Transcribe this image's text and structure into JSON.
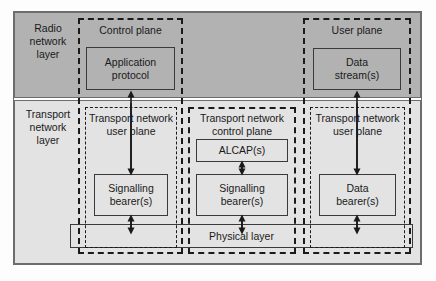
{
  "diagram": {
    "colors": {
      "radio_band_fill": "#b2b2b2",
      "transport_band_fill": "#e3e3e3",
      "line": "#1a1a1a",
      "frame": "#6d6d6d",
      "box_border": "#3a3a3a"
    },
    "layers": [
      {
        "id": "radio",
        "label": "Radio\nnetwork\nlayer"
      },
      {
        "id": "transport",
        "label": "Transport\nnetwork\nlayer"
      }
    ],
    "planes": [
      {
        "id": "control-plane",
        "label": "Control plane",
        "border": "thick-dashed"
      },
      {
        "id": "user-plane",
        "label": "User plane",
        "border": "thick-dashed"
      },
      {
        "id": "tn-user-plane-left",
        "label": "Transport network\nuser plane",
        "border": "thin-dashed"
      },
      {
        "id": "tn-control-plane",
        "label": "Transport network\ncontrol plane",
        "border": "thick-dashed"
      },
      {
        "id": "tn-user-plane-right",
        "label": "Transport network\nuser plane",
        "border": "thin-dashed"
      }
    ],
    "boxes": [
      {
        "id": "application-protocol",
        "label": "Application\nprotocol",
        "layer": "radio",
        "plane": "control-plane"
      },
      {
        "id": "data-stream",
        "label": "Data\nstream(s)",
        "layer": "radio",
        "plane": "user-plane"
      },
      {
        "id": "alcap",
        "label": "ALCAP(s)",
        "layer": "transport",
        "plane": "tn-control-plane"
      },
      {
        "id": "signalling-bearer-control",
        "label": "Signalling\nbearer(s)",
        "layer": "transport",
        "plane": "tn-control-plane"
      },
      {
        "id": "signalling-bearer-user",
        "label": "Signalling\nbearer(s)",
        "layer": "transport",
        "plane": "tn-user-plane-left"
      },
      {
        "id": "data-bearer",
        "label": "Data\nbearer(s)",
        "layer": "transport",
        "plane": "tn-user-plane-right"
      },
      {
        "id": "physical-layer",
        "label": "Physical layer",
        "layer": "transport",
        "plane": "spans-all"
      }
    ],
    "connections": [
      {
        "id": "app-protocol-to-signalling-bearer",
        "from": "signalling-bearer-user",
        "to": "application-protocol",
        "type": "single-arrow-up"
      },
      {
        "id": "data-stream-to-data-bearer",
        "from": "data-bearer",
        "to": "data-stream",
        "type": "single-arrow-up"
      },
      {
        "id": "alcap-to-signalling-bearer-control",
        "from": "alcap",
        "to": "signalling-bearer-control",
        "type": "double-arrow"
      },
      {
        "id": "signalling-bearer-control-to-physical",
        "from": "signalling-bearer-control",
        "to": "physical-layer",
        "type": "double-arrow"
      },
      {
        "id": "signalling-bearer-user-to-physical",
        "from": "signalling-bearer-user",
        "to": "physical-layer",
        "type": "double-arrow"
      },
      {
        "id": "data-bearer-to-physical",
        "from": "data-bearer",
        "to": "physical-layer",
        "type": "double-arrow"
      }
    ]
  }
}
